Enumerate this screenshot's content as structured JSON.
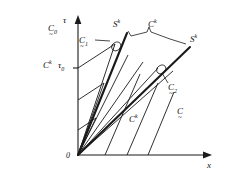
{
  "figure": {
    "type": "characteristic-shock-diagram"
  },
  "axes": {
    "vertical_label": "τ",
    "horizontal_label": "x",
    "origin_label": "0",
    "tick_label": "τ",
    "tick_sub": "0"
  },
  "labels": {
    "region_c0": {
      "base": "C",
      "sub": "0",
      "accent": "~"
    },
    "region_c1": {
      "base": "C",
      "sub": "1",
      "accent": "~"
    },
    "region_c2": {
      "base": "C",
      "sub": "2",
      "accent": "~"
    },
    "region_c": {
      "base": "C",
      "sub": "",
      "accent": "~"
    },
    "char_left": {
      "base": "C",
      "sup": "k"
    },
    "char_top": {
      "base": "C",
      "sup": "k"
    },
    "char_bottom": {
      "base": "C",
      "sup": "k"
    },
    "shock_left": {
      "base": "S",
      "sup": "k"
    },
    "shock_right": {
      "base": "S",
      "sup": "k"
    }
  },
  "geometry": {
    "origin": [
      78,
      155
    ],
    "x_axis_end": [
      212,
      155
    ],
    "tau_axis_top": [
      78,
      18
    ],
    "tau0_y": 68,
    "fan_rays_count": 7,
    "shock_left_end": [
      127,
      33
    ],
    "shock_right_end": [
      190,
      47
    ],
    "parallel_lines_count": 3
  },
  "colors": {
    "stroke": "#1a1a1a",
    "background": "#ffffff"
  }
}
